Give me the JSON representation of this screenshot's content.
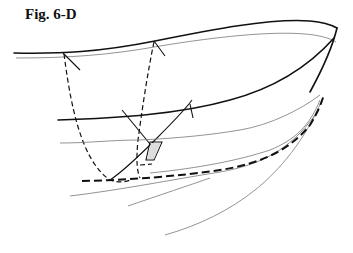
{
  "figure": {
    "label": "Fig. 6-D"
  }
}
